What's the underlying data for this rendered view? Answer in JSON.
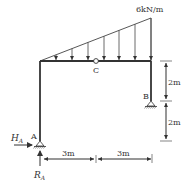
{
  "diagram": {
    "type": "structural-frame",
    "load": {
      "label": "6kN/m",
      "kind": "triangular-distributed",
      "max_intensity": "6kN/m",
      "arrow_count": 7
    },
    "points": {
      "A": "A",
      "B": "B",
      "C": "C"
    },
    "reactions": {
      "horizontal": {
        "symbol": "H",
        "subscript": "A"
      },
      "vertical": {
        "symbol": "R",
        "subscript": "A"
      }
    },
    "dimensions": {
      "horizontal_left": "3m",
      "horizontal_right": "3m",
      "vertical_upper": "2m",
      "vertical_lower": "2m"
    },
    "colors": {
      "member": "#333333",
      "load": "#444444",
      "text": "#333333"
    }
  }
}
